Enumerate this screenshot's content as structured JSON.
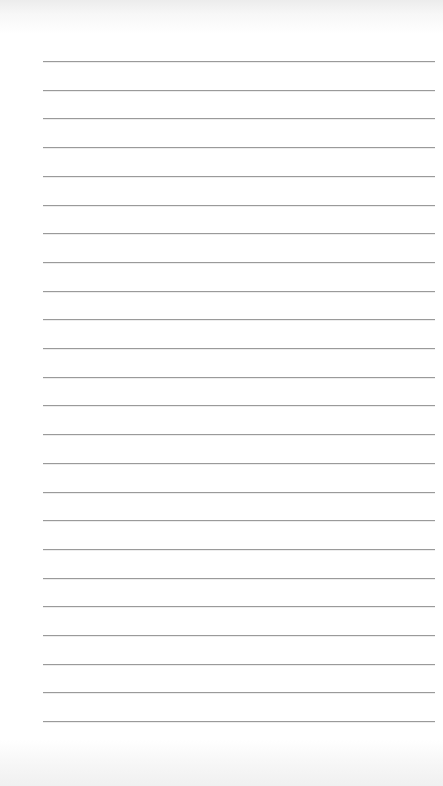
{
  "page": {
    "type": "lined-paper",
    "background_color": "#ffffff",
    "line_color": "#9a9a9a",
    "line_count": 24,
    "line_left": 43,
    "line_right": 435,
    "first_line_y": 61,
    "line_spacing": 28.7
  }
}
